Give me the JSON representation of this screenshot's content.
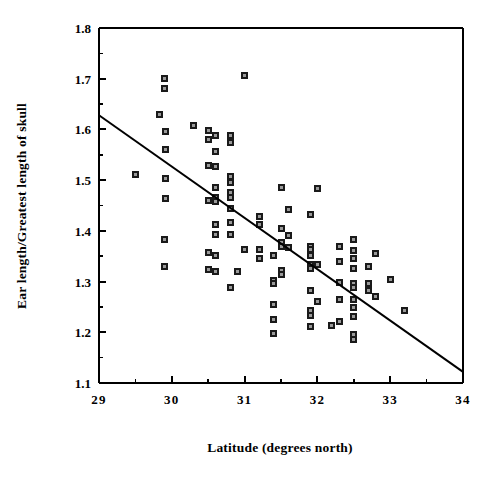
{
  "chart_data": {
    "type": "scatter",
    "title": "",
    "xlabel": "Latitude (degrees north)",
    "ylabel": "Ear length/Greatest length of skull",
    "xlim": [
      29,
      34
    ],
    "ylim": [
      1.1,
      1.8
    ],
    "xticks": [
      29,
      30,
      31,
      32,
      33,
      34
    ],
    "xtick_labels": [
      "29",
      "30",
      "31",
      "32",
      "33",
      "34"
    ],
    "yticks": [
      1.1,
      1.2,
      1.3,
      1.4,
      1.5,
      1.6,
      1.7,
      1.8
    ],
    "ytick_labels": [
      "1.1",
      "1.2",
      "1.3",
      "1.4",
      "1.5",
      "1.6",
      "1.7",
      "1.8"
    ],
    "x_minor_ticks": [
      29.5,
      30.5,
      31.5,
      32.5,
      33.5
    ],
    "y_minor_ticks": [
      1.15,
      1.25,
      1.35,
      1.45,
      1.55,
      1.65,
      1.75
    ],
    "grid": false,
    "legend": null,
    "marker": {
      "shape": "square",
      "fill": "#1a1a1a",
      "center": "#9a9a9a",
      "size_px": 7
    },
    "series": [
      {
        "name": "specimens",
        "marker_color": "#1a1a1a",
        "points": [
          [
            29.5,
            1.512
          ],
          [
            29.83,
            1.63
          ],
          [
            29.9,
            1.7
          ],
          [
            29.9,
            1.68
          ],
          [
            29.92,
            1.596
          ],
          [
            29.92,
            1.561
          ],
          [
            29.92,
            1.504
          ],
          [
            29.92,
            1.464
          ],
          [
            29.9,
            1.382
          ],
          [
            29.9,
            1.329
          ],
          [
            30.3,
            1.607
          ],
          [
            30.5,
            1.597
          ],
          [
            30.5,
            1.58
          ],
          [
            30.5,
            1.528
          ],
          [
            30.5,
            1.46
          ],
          [
            30.5,
            1.357
          ],
          [
            30.5,
            1.323
          ],
          [
            30.6,
            1.588
          ],
          [
            30.6,
            1.556
          ],
          [
            30.6,
            1.526
          ],
          [
            30.6,
            1.486
          ],
          [
            30.6,
            1.466
          ],
          [
            30.6,
            1.458
          ],
          [
            30.6,
            1.412
          ],
          [
            30.6,
            1.392
          ],
          [
            30.6,
            1.352
          ],
          [
            30.6,
            1.32
          ],
          [
            30.8,
            1.589
          ],
          [
            30.8,
            1.575
          ],
          [
            30.8,
            1.508
          ],
          [
            30.8,
            1.496
          ],
          [
            30.8,
            1.476
          ],
          [
            30.8,
            1.466
          ],
          [
            30.8,
            1.444
          ],
          [
            30.8,
            1.417
          ],
          [
            30.8,
            1.392
          ],
          [
            30.8,
            1.288
          ],
          [
            30.9,
            1.319
          ],
          [
            31.0,
            1.706
          ],
          [
            31.0,
            1.363
          ],
          [
            31.2,
            1.428
          ],
          [
            31.2,
            1.412
          ],
          [
            31.2,
            1.364
          ],
          [
            31.2,
            1.345
          ],
          [
            31.4,
            1.352
          ],
          [
            31.4,
            1.303
          ],
          [
            31.4,
            1.296
          ],
          [
            31.4,
            1.255
          ],
          [
            31.4,
            1.226
          ],
          [
            31.4,
            1.197
          ],
          [
            31.5,
            1.486
          ],
          [
            31.5,
            1.405
          ],
          [
            31.5,
            1.377
          ],
          [
            31.5,
            1.37
          ],
          [
            31.5,
            1.322
          ],
          [
            31.5,
            1.313
          ],
          [
            31.6,
            1.442
          ],
          [
            31.6,
            1.39
          ],
          [
            31.6,
            1.368
          ],
          [
            31.9,
            1.432
          ],
          [
            31.9,
            1.37
          ],
          [
            31.9,
            1.363
          ],
          [
            31.9,
            1.352
          ],
          [
            31.9,
            1.334
          ],
          [
            31.9,
            1.325
          ],
          [
            31.9,
            1.282
          ],
          [
            31.9,
            1.242
          ],
          [
            31.9,
            1.234
          ],
          [
            31.9,
            1.212
          ],
          [
            32.0,
            1.484
          ],
          [
            32.0,
            1.334
          ],
          [
            32.0,
            1.261
          ],
          [
            32.2,
            1.213
          ],
          [
            32.3,
            1.369
          ],
          [
            32.3,
            1.34
          ],
          [
            32.3,
            1.299
          ],
          [
            32.3,
            1.264
          ],
          [
            32.3,
            1.222
          ],
          [
            32.5,
            1.382
          ],
          [
            32.5,
            1.362
          ],
          [
            32.5,
            1.345
          ],
          [
            32.5,
            1.325
          ],
          [
            32.5,
            1.297
          ],
          [
            32.5,
            1.288
          ],
          [
            32.5,
            1.264
          ],
          [
            32.5,
            1.249
          ],
          [
            32.5,
            1.232
          ],
          [
            32.5,
            1.196
          ],
          [
            32.5,
            1.185
          ],
          [
            32.7,
            1.33
          ],
          [
            32.7,
            1.297
          ],
          [
            32.7,
            1.283
          ],
          [
            32.8,
            1.356
          ],
          [
            32.8,
            1.27
          ],
          [
            33.0,
            1.305
          ],
          [
            33.2,
            1.242
          ]
        ]
      }
    ],
    "trendline": {
      "type": "linear-regression",
      "x_start": 29,
      "y_start": 1.628,
      "x_end": 34,
      "y_end": 1.122,
      "color": "#000000",
      "width_px": 2
    }
  }
}
